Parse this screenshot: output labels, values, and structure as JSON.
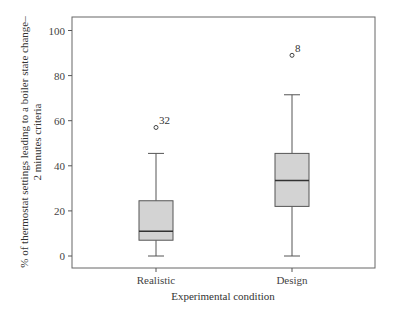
{
  "chart_data": {
    "type": "boxplot",
    "title": "",
    "xlabel": "Experimental condition",
    "ylabel_line1": "% of thermostat settings leading to a boiler state change–",
    "ylabel_line2": "2 minutes criteria",
    "ylim": [
      -5,
      105
    ],
    "yticks": [
      0,
      20,
      40,
      60,
      80,
      100
    ],
    "grid": false,
    "legend": null,
    "categories": [
      "Realistic",
      "Design"
    ],
    "series": [
      {
        "name": "Realistic",
        "whisker_low": 0,
        "q1": 7,
        "median": 11,
        "q3": 24.5,
        "whisker_high": 45.5,
        "outliers": [
          {
            "value": 57,
            "label": "32"
          }
        ]
      },
      {
        "name": "Design",
        "whisker_low": 0,
        "q1": 22,
        "median": 33.5,
        "q3": 45.5,
        "whisker_high": 71.5,
        "outliers": [
          {
            "value": 89,
            "label": "8"
          }
        ]
      }
    ],
    "colors": {
      "box_fill": "#d3d3d3",
      "box_stroke": "#555555",
      "median": "#333333",
      "axis": "#555555"
    }
  }
}
